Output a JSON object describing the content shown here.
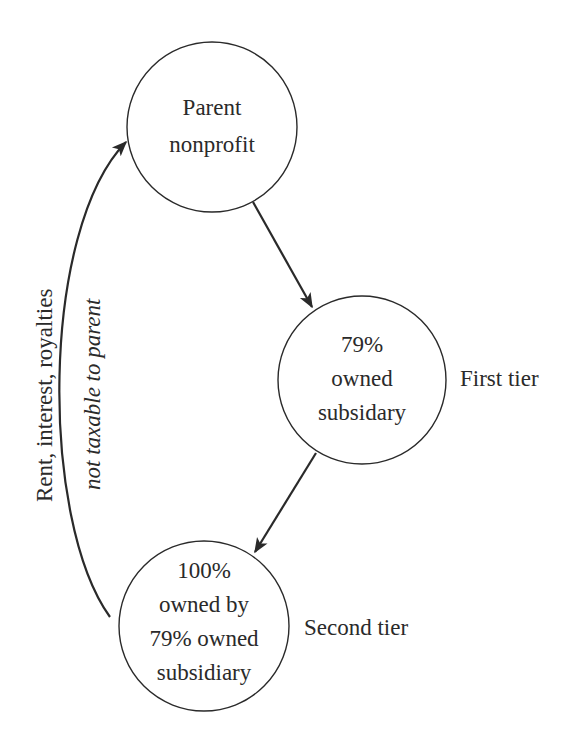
{
  "nodes": {
    "parent": {
      "lines": [
        "Parent",
        "nonprofit"
      ]
    },
    "first": {
      "lines": [
        "79%",
        "owned",
        "subsidary"
      ],
      "tier_label": "First tier"
    },
    "second": {
      "lines": [
        "100%",
        "owned by",
        "79% owned",
        "subsidiary"
      ],
      "tier_label": "Second tier"
    }
  },
  "edges": {
    "return_flow": {
      "label_line1": "Rent, interest, royalties",
      "label_line2": "not taxable to parent"
    }
  },
  "colors": {
    "stroke": "#2a2a2a",
    "background": "#ffffff"
  }
}
